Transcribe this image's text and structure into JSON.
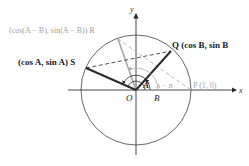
{
  "diagram": {
    "axes": {
      "x_label": "x",
      "y_label": "y"
    },
    "origin_label": "O",
    "points": {
      "P": {
        "label": "P (1, 0)",
        "color": "#a8a8a8"
      },
      "Q": {
        "label": "Q (cos B, sin B",
        "color": "#1a1a1a"
      },
      "R": {
        "label": "(cos(A − B), sin(A − B)) R",
        "color": "#a8a8a8"
      },
      "S": {
        "label": "(cos A, sin A) S",
        "color": "#1a1a1a"
      }
    },
    "angles": {
      "A": "A",
      "B": "B",
      "A_minus_B": "A − B"
    },
    "colors": {
      "dark": "#2a2a2a",
      "light": "#a8a8a8",
      "circle": "#555555"
    }
  }
}
